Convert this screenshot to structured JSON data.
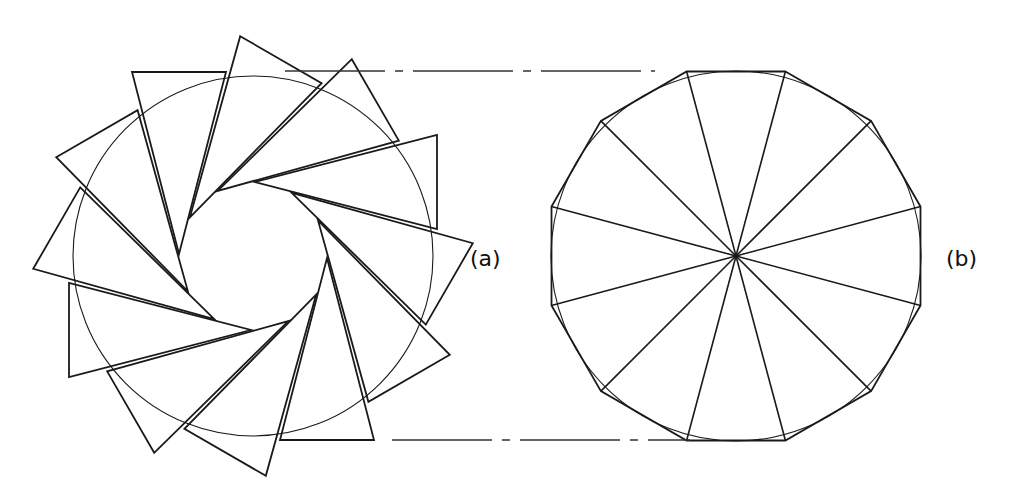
{
  "figure": {
    "label_a": "(a)",
    "label_b": "(b)",
    "colors": {
      "stroke": "#1a1a1a",
      "background": "#ffffff"
    },
    "panel_a": {
      "description": "Twelve triangles arranged in a pinwheel around a circle",
      "triangle_count": 12,
      "center": [
        253,
        256
      ],
      "circle_radius": 180,
      "base_triangle": [
        [
          132,
          72
        ],
        [
          226,
          72
        ],
        [
          179,
          254
        ]
      ]
    },
    "panel_b": {
      "description": "Regular dodecagon with twelve radial triangles meeting at center, circumscribed circle",
      "sides": 12,
      "center": [
        736,
        256
      ],
      "radius": 191,
      "circle_radius": 185
    },
    "guides": {
      "top_y": 71,
      "bottom_y": 440
    }
  }
}
